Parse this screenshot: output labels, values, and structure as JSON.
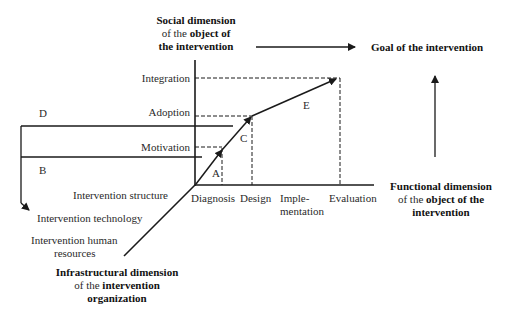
{
  "axes": {
    "social": {
      "title_bold": "Social dimension",
      "line2_normal": "of the ",
      "line2_bold": "object of",
      "line3_bold": "the intervention",
      "levels": [
        "Integration",
        "Adoption",
        "Motivation"
      ]
    },
    "functional": {
      "title_bold": "Functional dimension",
      "line2_normal": "of the ",
      "line2_bold": "object of the",
      "line3_bold": "intervention",
      "phases": [
        "Diagnosis",
        "Design",
        "Imple-",
        "mentation",
        "Evaluation"
      ]
    },
    "infrastructural": {
      "title_bold": "Infrastructural dimension",
      "line2_normal": "of the ",
      "line2_bold": "intervention",
      "line3_bold": "organization",
      "items": [
        "Intervention structure",
        "Intervention technology",
        "Intervention human",
        "resources"
      ]
    }
  },
  "goal": "Goal of the intervention",
  "segment_labels": {
    "A": "A",
    "B": "B",
    "C": "C",
    "D": "D",
    "E": "E"
  },
  "colors": {
    "line": "#1a1a1a",
    "text": "#2a2a2a"
  }
}
